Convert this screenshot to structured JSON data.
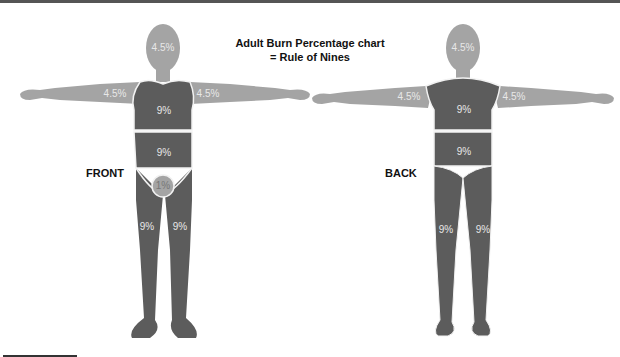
{
  "title": {
    "line1": "Adult Burn Percentage chart",
    "line2": "= Rule of Nines"
  },
  "figures": {
    "front": {
      "label": "FRONT",
      "head": "4.5%",
      "left_arm": "4.5%",
      "right_arm": "4.5%",
      "chest": "9%",
      "abdomen": "9%",
      "genitals": "1%",
      "left_leg": "9%",
      "right_leg": "9%"
    },
    "back": {
      "label": "BACK",
      "head": "4.5%",
      "left_arm": "4.5%",
      "right_arm": "4.5%",
      "upper_back": "9%",
      "lower_back": "9%",
      "left_leg": "9%",
      "right_leg": "9%"
    }
  },
  "colors": {
    "light_region": "#a4a4a4",
    "dark_region": "#5c5c5c",
    "outline": "#f2f2f2"
  }
}
